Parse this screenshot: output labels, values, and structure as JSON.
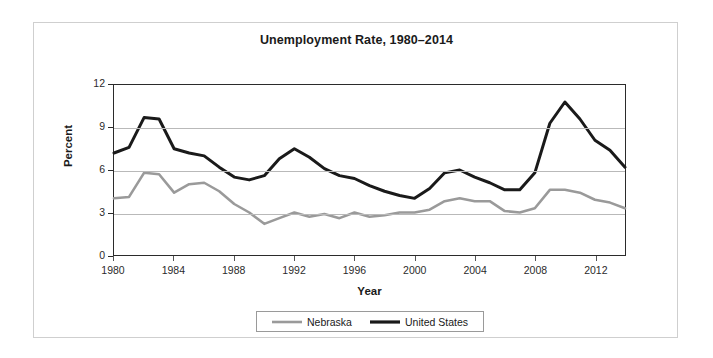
{
  "chart_data": {
    "type": "line",
    "title": "Unemployment Rate, 1980–2014",
    "xlabel": "Year",
    "ylabel": "Percent",
    "xlim": [
      1980,
      2014
    ],
    "ylim": [
      0,
      12
    ],
    "yticks": [
      0,
      3,
      6,
      9,
      12
    ],
    "xticks": [
      1980,
      1984,
      1988,
      1992,
      1996,
      2000,
      2004,
      2008,
      2012
    ],
    "grid": "horizontal",
    "legend_position": "bottom-center",
    "x": [
      1980,
      1981,
      1982,
      1983,
      1984,
      1985,
      1986,
      1987,
      1988,
      1989,
      1990,
      1991,
      1992,
      1993,
      1994,
      1995,
      1996,
      1997,
      1998,
      1999,
      2000,
      2001,
      2002,
      2003,
      2004,
      2005,
      2006,
      2007,
      2008,
      2009,
      2010,
      2011,
      2012,
      2013,
      2014
    ],
    "series": [
      {
        "name": "Nebraska",
        "color": "#9a9a9a",
        "values": [
          4.0,
          4.1,
          5.8,
          5.7,
          4.4,
          5.0,
          5.1,
          4.5,
          3.6,
          3.0,
          2.2,
          2.6,
          3.0,
          2.7,
          2.9,
          2.6,
          3.0,
          2.7,
          2.8,
          3.0,
          3.0,
          3.2,
          3.8,
          4.0,
          3.8,
          3.8,
          3.1,
          3.0,
          3.3,
          4.6,
          4.6,
          4.4,
          3.9,
          3.7,
          3.3
        ]
      },
      {
        "name": "United States",
        "color": "#1a1a1a",
        "values": [
          7.2,
          7.6,
          9.7,
          9.6,
          7.5,
          7.2,
          7.0,
          6.2,
          5.5,
          5.3,
          5.6,
          6.8,
          7.5,
          6.9,
          6.1,
          5.6,
          5.4,
          4.9,
          4.5,
          4.2,
          4.0,
          4.7,
          5.8,
          6.0,
          5.5,
          5.1,
          4.6,
          4.6,
          5.8,
          9.3,
          10.8,
          9.6,
          8.1,
          7.4,
          6.2
        ]
      }
    ]
  },
  "legend": {
    "entries": [
      {
        "label": "Nebraska"
      },
      {
        "label": "United States"
      }
    ]
  }
}
